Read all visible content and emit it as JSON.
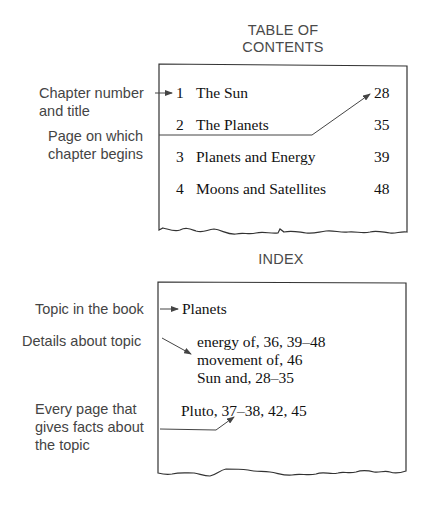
{
  "toc": {
    "title_line1": "TABLE OF",
    "title_line2": "CONTENTS",
    "entries": [
      {
        "number": "1",
        "title": "The Sun",
        "page": "28"
      },
      {
        "number": "2",
        "title": "The Planets",
        "page": "35"
      },
      {
        "number": "3",
        "title": "Planets and Energy",
        "page": "39"
      },
      {
        "number": "4",
        "title": "Moons and Satellites",
        "page": "48"
      }
    ],
    "labels": {
      "chapter_line1": "Chapter number",
      "chapter_line2": "and title",
      "page_line1": "Page on which",
      "page_line2": "chapter begins"
    }
  },
  "index": {
    "title": "INDEX",
    "topic": "Planets",
    "details": [
      "energy of, 36, 39–48",
      "movement of, 46",
      "Sun and, 28–35"
    ],
    "entry": "Pluto, 37–38, 42, 45",
    "labels": {
      "topic": "Topic in the book",
      "details": "Details about topic",
      "pages_line1": "Every page that",
      "pages_line2": "gives facts about",
      "pages_line3": "the topic"
    }
  },
  "colors": {
    "label_text": "#444444",
    "body_text": "#111111",
    "line": "#333333"
  }
}
